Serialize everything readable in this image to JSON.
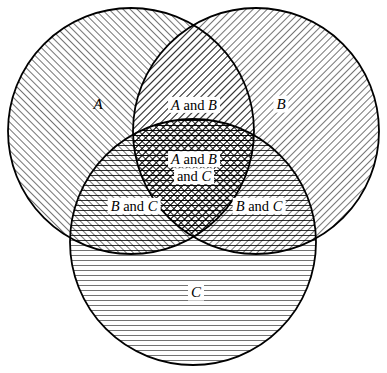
{
  "figure": {
    "kind": "venn-diagram",
    "set_count": 3,
    "background_color": "#ffffff",
    "stroke_color": "#000000"
  },
  "sets": [
    {
      "id": "A",
      "label": "A",
      "hatch": "diagonal-up",
      "cx": 131,
      "cy": 131,
      "r": 123
    },
    {
      "id": "B",
      "label": "B",
      "hatch": "diagonal-down",
      "cx": 256,
      "cy": 131,
      "r": 123
    },
    {
      "id": "C",
      "label": "C",
      "hatch": "horizontal",
      "cx": 193,
      "cy": 242,
      "r": 123
    }
  ],
  "regions": [
    {
      "id": "only-a",
      "name": "region-a",
      "label": "A",
      "letters": [
        "A"
      ],
      "conjunction": "",
      "x": 98,
      "y": 104,
      "boxed": false,
      "size": "solo"
    },
    {
      "id": "only-b",
      "name": "region-b",
      "label": "B",
      "letters": [
        "B"
      ],
      "conjunction": "",
      "x": 281,
      "y": 104,
      "boxed": true,
      "size": "solo"
    },
    {
      "id": "only-c",
      "name": "region-c",
      "label": "C",
      "letters": [
        "C"
      ],
      "conjunction": "",
      "x": 196,
      "y": 292,
      "boxed": true,
      "size": "solo"
    },
    {
      "id": "a-and-b",
      "name": "region-a-and-b",
      "label": "A and B",
      "letters": [
        "A",
        "B"
      ],
      "conjunction": "and",
      "x": 194,
      "y": 105,
      "boxed": true,
      "size": "pair"
    },
    {
      "id": "a-and-c",
      "name": "region-a-and-c",
      "label": "B and C",
      "letters": [
        "B",
        "C"
      ],
      "conjunction": "and",
      "x": 134,
      "y": 206,
      "boxed": true,
      "size": "pair"
    },
    {
      "id": "b-and-c",
      "name": "region-b-and-c",
      "label": "B and C",
      "letters": [
        "B",
        "C"
      ],
      "conjunction": "and",
      "x": 259,
      "y": 206,
      "boxed": true,
      "size": "pair"
    }
  ],
  "center_region": {
    "id": "a-and-b-and-c",
    "name": "region-a-and-b-and-c",
    "line1": "A and B",
    "line2": "and C",
    "x": 194,
    "y": 168
  },
  "hatch_specs": {
    "diagonal_up_angle_deg": 45,
    "diagonal_down_angle_deg": -45,
    "horizontal_angle_deg": 0,
    "line_spacing_px": 5,
    "line_width_px": 1
  }
}
